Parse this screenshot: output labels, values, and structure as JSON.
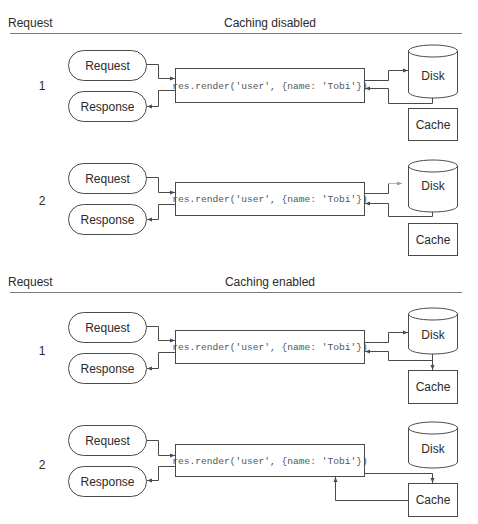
{
  "sections": [
    {
      "column_label": "Request",
      "title": "Caching disabled",
      "rows": [
        {
          "number": "1",
          "request_label": "Request",
          "response_label": "Response",
          "code": "res.render('user', {name: 'Tobi'})",
          "disk_label": "Disk",
          "cache_label": "Cache",
          "flow": "render -> Disk -> render"
        },
        {
          "number": "2",
          "request_label": "Request",
          "response_label": "Response",
          "code": "res.render('user', {name: 'Tobi'})",
          "disk_label": "Disk",
          "cache_label": "Cache",
          "flow": "render -> Disk -> render"
        }
      ]
    },
    {
      "column_label": "Request",
      "title": "Caching enabled",
      "rows": [
        {
          "number": "1",
          "request_label": "Request",
          "response_label": "Response",
          "code": "res.render('user', {name: 'Tobi'})",
          "disk_label": "Disk",
          "cache_label": "Cache",
          "flow": "render -> Disk -> Cache + render"
        },
        {
          "number": "2",
          "request_label": "Request",
          "response_label": "Response",
          "code": "res.render('user', {name: 'Tobi'})",
          "disk_label": "Disk",
          "cache_label": "Cache",
          "flow": "render -> Cache -> render"
        }
      ]
    }
  ],
  "colors": {
    "stroke": "#4a4a4a",
    "text": "#2b2b2b",
    "code_text": "#555555",
    "rule": "#7a7a7a",
    "background": "#ffffff"
  }
}
